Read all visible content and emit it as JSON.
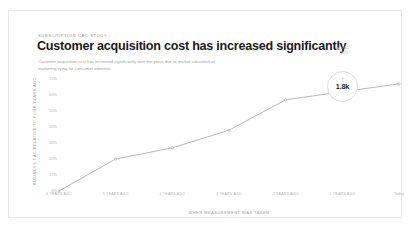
{
  "card": {
    "kicker": "SUBSCRIPTION CAC STUDY",
    "headline": "Customer acquisition cost has increased significantly",
    "subtitle": "Customer acquisition cost has increased significantly over the years due to market saturation of marketing vying for consumer attention."
  },
  "legend": {
    "marker": "dot-icon",
    "line1": "CAC",
    "line2": "ROI"
  },
  "annotation": {
    "caret": "▲",
    "value": "1.8k"
  },
  "colors": {
    "line": "#9b9b9b",
    "text_dark": "#1b1b1b",
    "text_muted": "#a8a8a8",
    "card_bg": "#ffffff",
    "card_border": "#e8e8e8"
  },
  "chart_data": {
    "type": "line",
    "title": "Customer acquisition cost has increased significantly",
    "xlabel": "WHEN MEASUREMENT WAS TAKEN",
    "ylabel": "BUSINESS CAC RELATIVE TO FOUR YEARS AGO",
    "categories": [
      "6 YEARS AGO",
      "5 YEARS AGO",
      "4 YEARS AGO",
      "3 YEARS AGO",
      "2 YEARS AGO",
      "1 YEARS AGO",
      "Today"
    ],
    "values": [
      0,
      20,
      27,
      38,
      57,
      62,
      67
    ],
    "ylim": [
      0,
      75
    ],
    "yticks": [
      70,
      60,
      50,
      40,
      30,
      20,
      10,
      0
    ],
    "ytick_labels": [
      "70%",
      "60%",
      "50%",
      "40%",
      "30%",
      "20%",
      "10%",
      "0%"
    ],
    "grid": false,
    "legend_position": "top-right",
    "markers": true,
    "series": [
      {
        "name": "CAC",
        "values": [
          0,
          20,
          27,
          38,
          57,
          62,
          67
        ]
      }
    ],
    "annotations": [
      {
        "label": "1.8k",
        "at_category": "Today"
      }
    ]
  }
}
